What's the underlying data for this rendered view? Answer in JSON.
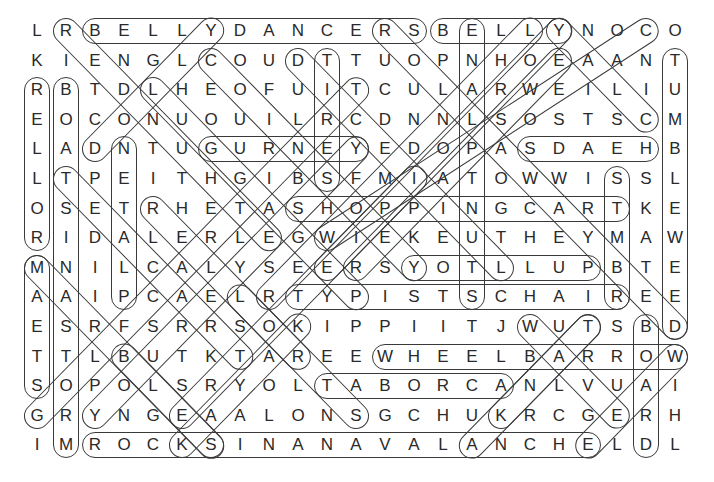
{
  "puzzle": {
    "type": "word-search",
    "rows": 15,
    "cols": 23,
    "grid": [
      "LRBELLYDANCERSBELLYNOCO",
      "KIENGLCOUDTTUOPNHOEAANT",
      "RBTDLHEOFUITCULARWEILIU",
      "EOCONUOUILRCDNNLSOSTSCM",
      "LADNTUGURNEYEDOPASDAEHB",
      "LTPEITHGIBSFMIATOWWISSL",
      "OSETRHETASHOPPINGCARTKE",
      "RIDALERLEGWIEKEUTHEYMAW",
      "MNILCALYSEERSYOTLLUPBTE",
      "AAIPCAELRTYPISTSCHAIREE",
      "ESRFSRRSOKIPPIITJWUTSBD",
      "TTLBUTKTAREEWHEELBARROW",
      "SOPOLSRYOLTABORCANLVUAI",
      "GRYNGEAALONSGCHUKRCGERH",
      "IMROCKSINANAVALANCHELDL"
    ],
    "found_words": [
      {
        "word": "BELLYDANCERS",
        "start": [
          1,
          3
        ],
        "end": [
          1,
          14
        ]
      },
      {
        "word": "BELLY",
        "start": [
          1,
          15
        ],
        "end": [
          1,
          19
        ]
      },
      {
        "word": "GURNEY",
        "start": [
          5,
          7
        ],
        "end": [
          5,
          12
        ]
      },
      {
        "word": "HEADS",
        "start": [
          5,
          22
        ],
        "end": [
          5,
          18
        ]
      },
      {
        "word": "SHOPPINGCART",
        "start": [
          7,
          10
        ],
        "end": [
          7,
          21
        ]
      },
      {
        "word": "PULLTOY",
        "start": [
          9,
          20
        ],
        "end": [
          9,
          14
        ]
      },
      {
        "word": "TYPISTSCHAIR",
        "start": [
          10,
          10
        ],
        "end": [
          10,
          21
        ]
      },
      {
        "word": "WHEELBARROW",
        "start": [
          12,
          13
        ],
        "end": [
          12,
          23
        ]
      },
      {
        "word": "ACROBAT",
        "start": [
          13,
          17
        ],
        "end": [
          13,
          11
        ]
      },
      {
        "word": "ROCKSINANAVALANCHE",
        "start": [
          15,
          3
        ],
        "end": [
          15,
          20
        ]
      },
      {
        "word": "ROLLER",
        "start": [
          8,
          1
        ],
        "end": [
          3,
          1
        ]
      },
      {
        "word": "STEAM",
        "start": [
          13,
          1
        ],
        "end": [
          9,
          1
        ]
      },
      {
        "word": "BOATSINASTORM",
        "start": [
          3,
          2
        ],
        "end": [
          15,
          2
        ]
      },
      {
        "word": "PLATEN",
        "start": [
          10,
          4
        ],
        "end": [
          5,
          4
        ]
      },
      {
        "word": "TIRES",
        "start": [
          2,
          11
        ],
        "end": [
          6,
          11
        ]
      },
      {
        "word": "STUNTPLANE",
        "start": [
          10,
          16
        ],
        "end": [
          1,
          16
        ]
      },
      {
        "word": "SKATE",
        "start": [
          6,
          21
        ],
        "end": [
          10,
          21
        ]
      },
      {
        "word": "BOARD",
        "start": [
          11,
          22
        ],
        "end": [
          15,
          22
        ]
      },
      {
        "word": "TUMBLEWEED",
        "start": [
          2,
          23
        ],
        "end": [
          11,
          23
        ]
      },
      {
        "word": "DOLLY",
        "start": [
          5,
          3
        ],
        "end": [
          1,
          7
        ]
      },
      {
        "word": "TEACART",
        "start": [
          6,
          2
        ],
        "end": [
          12,
          8
        ]
      },
      {
        "word": "RIDER",
        "start": [
          1,
          2
        ],
        "end": [
          8,
          9
        ]
      },
      {
        "word": "COUNTER",
        "start": [
          2,
          7
        ],
        "end": [
          9,
          14
        ]
      },
      {
        "word": "DIAGONAL-1",
        "start": [
          2,
          10
        ],
        "end": [
          9,
          17
        ]
      },
      {
        "word": "DIAGONAL-2",
        "start": [
          3,
          5
        ],
        "end": [
          10,
          12
        ]
      },
      {
        "word": "DIAGONAL-3",
        "start": [
          9,
          1
        ],
        "end": [
          15,
          7
        ]
      },
      {
        "word": "DIAGONAL-4",
        "start": [
          7,
          5
        ],
        "end": [
          12,
          10
        ]
      },
      {
        "word": "DIAGONAL-5",
        "start": [
          14,
          1
        ],
        "end": [
          3,
          12
        ]
      },
      {
        "word": "DIAGONAL-6",
        "start": [
          14,
          3
        ],
        "end": [
          5,
          12
        ]
      },
      {
        "word": "DIAGONAL-7",
        "start": [
          14,
          6
        ],
        "end": [
          6,
          14
        ]
      },
      {
        "word": "DIAGONAL-8",
        "start": [
          14,
          12
        ],
        "end": [
          10,
          8
        ]
      },
      {
        "word": "DIAGONAL-9",
        "start": [
          9,
          12
        ],
        "end": [
          2,
          19
        ]
      },
      {
        "word": "DIAGONAL-10",
        "start": [
          9,
          11
        ],
        "end": [
          1,
          19
        ]
      },
      {
        "word": "DIAGONAL-11",
        "start": [
          10,
          9
        ],
        "end": [
          1,
          18
        ]
      },
      {
        "word": "DIAGONAL-12",
        "start": [
          8,
          11
        ],
        "end": [
          1,
          22
        ]
      },
      {
        "word": "DIAGONAL-13",
        "start": [
          1,
          19
        ],
        "end": [
          4,
          22
        ]
      },
      {
        "word": "DIAGONAL-14",
        "start": [
          1,
          13
        ],
        "end": [
          11,
          23
        ]
      },
      {
        "word": "DIAGONAL-15",
        "start": [
          11,
          18
        ],
        "end": [
          14,
          21
        ]
      },
      {
        "word": "DIAGONAL-16",
        "start": [
          11,
          20
        ],
        "end": [
          15,
          16
        ]
      },
      {
        "word": "DIAGONAL-17",
        "start": [
          14,
          17
        ],
        "end": [
          11,
          20
        ]
      },
      {
        "word": "DIAGONAL-18",
        "start": [
          12,
          23
        ],
        "end": [
          15,
          20
        ]
      },
      {
        "word": "DIAGONAL-19",
        "start": [
          15,
          6
        ],
        "end": [
          11,
          10
        ]
      },
      {
        "word": "DIAGONAL-20",
        "start": [
          15,
          7
        ],
        "end": [
          12,
          4
        ]
      }
    ]
  },
  "colors": {
    "letter": "#2a2a2a",
    "loop": "#3a3a3a",
    "background": "#ffffff"
  },
  "geometry": {
    "x0": 37,
    "y0": 31,
    "dx": 29,
    "dy": 29.6
  }
}
